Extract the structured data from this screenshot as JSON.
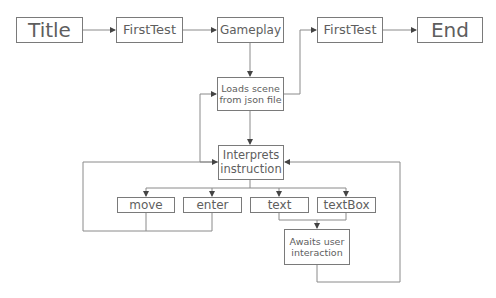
{
  "diagram": {
    "type": "flowchart",
    "nodes": {
      "title": "Title",
      "first_test_1": "FirstTest",
      "gameplay": "Gameplay",
      "first_test_2": "FirstTest",
      "end": "End",
      "loads_scene": "Loads scene\nfrom json file",
      "interprets": "Interprets\ninstruction",
      "move": "move",
      "enter": "enter",
      "text": "text",
      "textbox": "textBox",
      "awaits": "Awaits user\ninteraction"
    },
    "edges": [
      {
        "from": "Title",
        "to": "FirstTest"
      },
      {
        "from": "FirstTest",
        "to": "Gameplay"
      },
      {
        "from": "Gameplay",
        "to": "Loads scene from json file"
      },
      {
        "from": "Loads scene from json file",
        "to": "FirstTest (2)"
      },
      {
        "from": "FirstTest (2)",
        "to": "End"
      },
      {
        "from": "Loads scene from json file",
        "to": "Interprets instruction"
      },
      {
        "from": "Interprets instruction",
        "to": "Loads scene from json file"
      },
      {
        "from": "Interprets instruction",
        "to": "move"
      },
      {
        "from": "Interprets instruction",
        "to": "enter"
      },
      {
        "from": "Interprets instruction",
        "to": "text"
      },
      {
        "from": "Interprets instruction",
        "to": "textBox"
      },
      {
        "from": "move",
        "to": "Interprets instruction"
      },
      {
        "from": "enter",
        "to": "Interprets instruction"
      },
      {
        "from": "text",
        "to": "Awaits user interaction"
      },
      {
        "from": "textBox",
        "to": "Awaits user interaction"
      },
      {
        "from": "Awaits user interaction",
        "to": "Interprets instruction"
      }
    ]
  }
}
